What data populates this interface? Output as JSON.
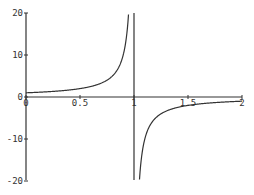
{
  "chart_data": {
    "type": "line",
    "title": "",
    "xlabel": "",
    "ylabel": "",
    "function": "1/(1-x)",
    "xlim": [
      0,
      2
    ],
    "ylim": [
      -20,
      20
    ],
    "grid": false,
    "legend": null,
    "x_ticks": [
      "0",
      "0.5",
      "1",
      "1.5",
      "2"
    ],
    "y_ticks": [
      "-20",
      "-10",
      "0",
      "10",
      "20"
    ],
    "asymptote_x": 1,
    "series": [
      {
        "name": "y = 1/(1-x)",
        "x": [
          0,
          0.25,
          0.5,
          0.75,
          0.9,
          0.95,
          1.05,
          1.1,
          1.25,
          1.5,
          1.75,
          2
        ],
        "y": [
          1,
          1.33,
          2,
          4,
          10,
          20,
          -20,
          -10,
          -4,
          -2,
          -1.33,
          -1
        ]
      }
    ],
    "color": "#333333"
  }
}
